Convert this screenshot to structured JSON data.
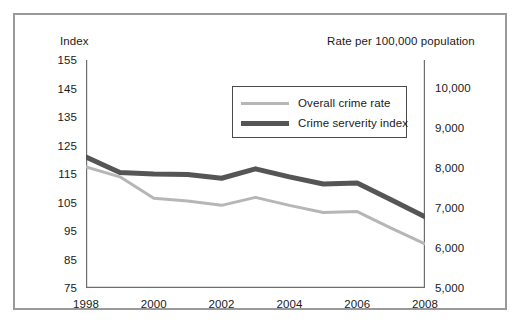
{
  "chart_data": {
    "type": "line",
    "title": "",
    "xlabel": "",
    "ylabel": "Index",
    "y2label": "Rate per 100,000 population",
    "grid": false,
    "legend_position": "inside-top-center",
    "x": [
      1998,
      1999,
      2000,
      2001,
      2002,
      2003,
      2004,
      2005,
      2006,
      2007,
      2008
    ],
    "xtick_labels": [
      "1998",
      "2000",
      "2002",
      "2004",
      "2006",
      "2008"
    ],
    "xtick_values": [
      1998,
      2000,
      2002,
      2004,
      2006,
      2008
    ],
    "xminor_values": [
      1999,
      2001,
      2003,
      2005,
      2007
    ],
    "xlim": [
      1998,
      2008
    ],
    "ylim": [
      75,
      155
    ],
    "ytick_labels": [
      "155",
      "145",
      "135",
      "125",
      "115",
      "105",
      "95",
      "85",
      "75"
    ],
    "ytick_values": [
      155,
      145,
      135,
      125,
      115,
      105,
      95,
      85,
      75
    ],
    "y2lim": [
      5000,
      10700
    ],
    "y2tick_labels": [
      "10,000",
      "9,000",
      "8,000",
      "7,000",
      "6,000",
      "5,000"
    ],
    "y2tick_values": [
      10000,
      9000,
      8000,
      7000,
      6000,
      5000
    ],
    "series": [
      {
        "name": "Overall crime rate",
        "axis": "left",
        "color": "#b6b6b6",
        "width": 3,
        "values": [
          117.5,
          114.0,
          106.5,
          105.5,
          104.0,
          106.8,
          104.0,
          101.5,
          101.8,
          96.0,
          90.5
        ]
      },
      {
        "name": "Crime serverity index",
        "axis": "left",
        "color": "#555555",
        "width": 5,
        "values": [
          121.0,
          115.5,
          115.0,
          114.8,
          113.5,
          116.8,
          114.0,
          111.5,
          111.8,
          106.0,
          100.0
        ]
      }
    ]
  },
  "axes": {
    "left_title": "Index",
    "right_title": "Rate per 100,000 population"
  },
  "legend": {
    "entries": [
      {
        "label": "Overall crime rate",
        "swatch": "thin-gray-line"
      },
      {
        "label": "Crime serverity index",
        "swatch": "thick-dark-line"
      }
    ]
  },
  "colors": {
    "frame": "#9a9a9a",
    "axis": "#6e6e6e",
    "series_light": "#b6b6b6",
    "series_dark": "#555555",
    "text": "#1a1a1a",
    "background": "#ffffff"
  }
}
